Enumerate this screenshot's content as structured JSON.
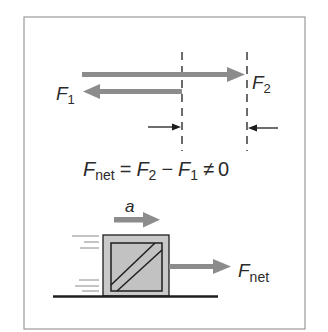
{
  "figure": {
    "top": {
      "force1": {
        "symbol": "F",
        "subscript": "1"
      },
      "force2": {
        "symbol": "F",
        "subscript": "2"
      }
    },
    "equation": {
      "lhs_symbol": "F",
      "lhs_subscript": "net",
      "equals": "=",
      "term1_symbol": "F",
      "term1_subscript": "2",
      "minus": "−",
      "term2_symbol": "F",
      "term2_subscript": "1",
      "neq": "≠",
      "rhs": "0"
    },
    "bottom": {
      "acceleration_label": "a",
      "net_force": {
        "symbol": "F",
        "subscript": "net"
      }
    },
    "colors": {
      "arrow": "#8c8c8c",
      "box_fill": "#c9c9c9",
      "line": "#1e1e1e",
      "frame": "#9a9a9a"
    }
  }
}
